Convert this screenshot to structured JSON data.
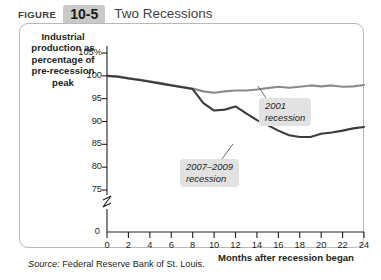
{
  "header": {
    "figure_word": "FIGURE",
    "figure_number": "10-5",
    "title": "Two Recessions"
  },
  "axes": {
    "y_title": "Industrial production as percentage of pre-recession peak",
    "x_title": "Months after recession began",
    "y_ticks": [
      "105%",
      "100",
      "95",
      "90",
      "85",
      "80",
      "75"
    ],
    "y_break_label": "0",
    "x_ticks": [
      "0",
      "2",
      "4",
      "6",
      "8",
      "10",
      "12",
      "14",
      "16",
      "18",
      "20",
      "22",
      "24"
    ]
  },
  "callouts": {
    "recession_2001": {
      "line1": "2001",
      "line2": "recession"
    },
    "recession_2007_2009": {
      "line1": "2007–2009",
      "line2": "recession"
    }
  },
  "source": {
    "label": "Source:",
    "text": "Federal Reserve Bank of St. Louis."
  },
  "colors": {
    "series_2001": "#8c8c8c",
    "series_2007_2009": "#3b3b3b",
    "frame": "#b8b8b8",
    "callout_bg": "#e2e2e2",
    "tab_bg": "#c9c9c9",
    "axis": "#231f20"
  },
  "chart_data": {
    "type": "line",
    "title": "Two Recessions",
    "xlabel": "Months after recession began",
    "ylabel": "Industrial production as percentage of pre-recession peak",
    "xlim": [
      0,
      24
    ],
    "ylim": [
      75,
      105
    ],
    "grid": false,
    "legend": "annotations",
    "x": [
      0,
      1,
      2,
      3,
      4,
      5,
      6,
      7,
      8,
      9,
      10,
      11,
      12,
      13,
      14,
      15,
      16,
      17,
      18,
      19,
      20,
      21,
      22,
      23,
      24
    ],
    "series": [
      {
        "name": "2001 recession",
        "color": "#8c8c8c",
        "values": [
          100.0,
          99.9,
          99.5,
          99.2,
          98.8,
          98.4,
          98.0,
          97.6,
          97.2,
          96.6,
          96.3,
          96.6,
          96.8,
          96.8,
          97.0,
          97.3,
          97.6,
          97.4,
          97.6,
          97.9,
          97.7,
          97.9,
          97.6,
          97.7,
          98.0
        ]
      },
      {
        "name": "2007–2009 recession",
        "color": "#3b3b3b",
        "values": [
          100.0,
          99.8,
          99.4,
          99.1,
          98.7,
          98.3,
          97.9,
          97.5,
          97.1,
          94.0,
          92.4,
          92.6,
          93.3,
          91.8,
          90.3,
          89.2,
          88.0,
          87.0,
          86.6,
          86.6,
          87.3,
          87.6,
          88.0,
          88.5,
          88.8
        ]
      }
    ],
    "annotations": [
      {
        "text": "2001 recession",
        "x": 15.5,
        "y": 93.5
      },
      {
        "text": "2007–2009 recession",
        "x": 8.0,
        "y": 80.5
      }
    ]
  }
}
